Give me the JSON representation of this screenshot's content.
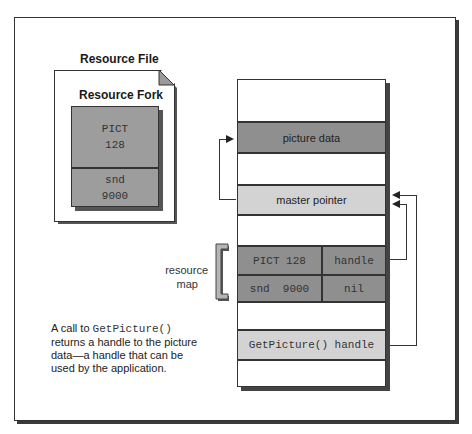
{
  "resource_file": {
    "title": "Resource File",
    "fork_title": "Resource Fork",
    "entries": [
      {
        "type": "PICT",
        "id": "128"
      },
      {
        "type": "snd",
        "id": "9000"
      }
    ]
  },
  "memory": {
    "rows": {
      "picture_data": "picture data",
      "master_pointer": "master pointer",
      "map": [
        {
          "name": "PICT 128",
          "value": "handle"
        },
        {
          "name": "snd  9000",
          "value": "nil"
        }
      ],
      "get_picture": "GetPicture() handle"
    }
  },
  "labels": {
    "resource_map_line1": "resource",
    "resource_map_line2": "map"
  },
  "note": {
    "prefix": "A call to ",
    "code": "GetPicture()",
    "suffix": " returns a handle to the picture data—a handle that can be used by the application."
  },
  "colors": {
    "dark_fill": "#8f8f8f",
    "light_fill": "#d3d3d3",
    "stroke": "#333333"
  }
}
